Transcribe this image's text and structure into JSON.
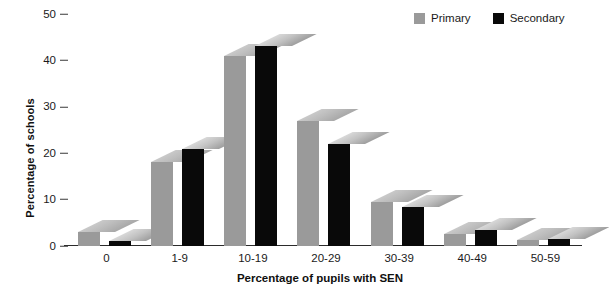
{
  "chart_data": {
    "type": "bar",
    "title": "",
    "xlabel": "Percentage of pupils with SEN",
    "ylabel": "Percentage of schools",
    "categories": [
      "0",
      "1-9",
      "10-19",
      "20-29",
      "30-39",
      "40-49",
      "50-59"
    ],
    "series": [
      {
        "name": "Primary",
        "color": "#9a9a9a",
        "values": [
          3,
          18,
          41,
          27,
          9.5,
          2.5,
          1.2
        ]
      },
      {
        "name": "Secondary",
        "color": "#090909",
        "values": [
          1,
          21,
          43,
          22,
          8.5,
          3.5,
          1.5
        ]
      }
    ],
    "ylim": [
      0,
      50
    ],
    "yticks": [
      0,
      10,
      20,
      30,
      40,
      50
    ],
    "ytick_labels": [
      "0",
      "10",
      "20",
      "30",
      "40",
      "50"
    ],
    "grid": false,
    "legend_position": "top-right",
    "style_note": "3D extruded bars with skewed top faces"
  },
  "legend": {
    "entries": [
      {
        "label": "Primary",
        "swatch": "#9a9a9a"
      },
      {
        "label": "Secondary",
        "swatch": "#090909"
      }
    ]
  }
}
